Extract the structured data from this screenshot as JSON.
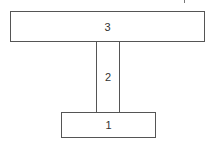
{
  "diagram": {
    "type": "T-section / stacked components",
    "parts": [
      {
        "id": "top",
        "label": "3"
      },
      {
        "id": "stem",
        "label": "2"
      },
      {
        "id": "base",
        "label": "1"
      }
    ]
  },
  "colors": {
    "stroke": "#555555",
    "text": "#333333",
    "background": "#ffffff"
  }
}
